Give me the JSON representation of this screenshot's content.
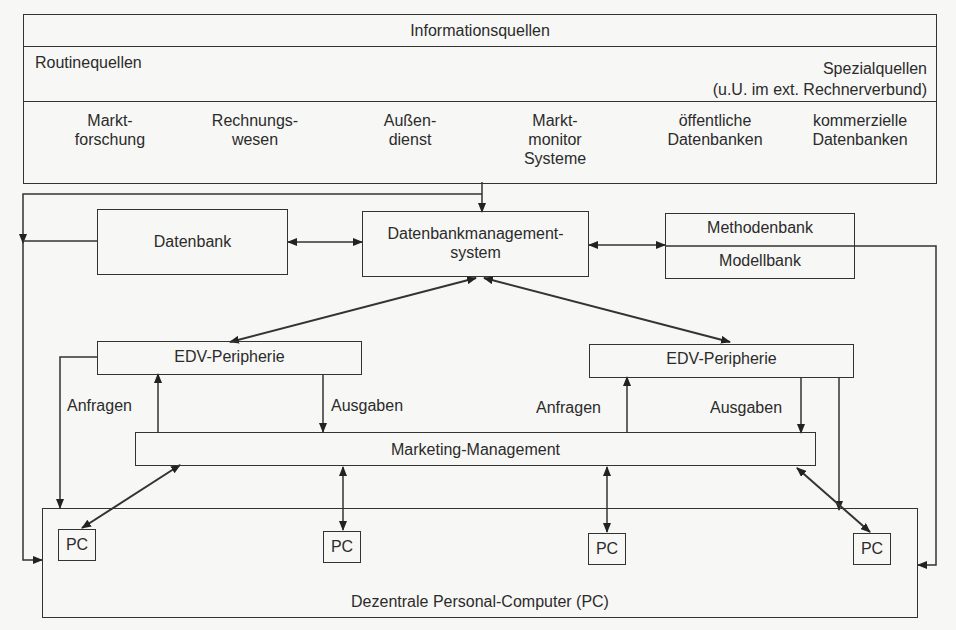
{
  "diagram": {
    "sources": {
      "title": "Informationsquellen",
      "routine_label": "Routinequellen",
      "special_label_1": "Spezialquellen",
      "special_label_2": "(u.U. im ext. Rechnerverbund)",
      "items": [
        {
          "line1": "Markt-",
          "line2": "forschung",
          "line3": ""
        },
        {
          "line1": "Rechnungs-",
          "line2": "wesen",
          "line3": ""
        },
        {
          "line1": "Außen-",
          "line2": "dienst",
          "line3": ""
        },
        {
          "line1": "Markt-",
          "line2": "monitor",
          "line3": "Systeme"
        },
        {
          "line1": "öffentliche",
          "line2": "Datenbanken",
          "line3": ""
        },
        {
          "line1": "kommerzielle",
          "line2": "Datenbanken",
          "line3": ""
        }
      ]
    },
    "datenbank": "Datenbank",
    "dbms_line1": "Datenbankmanagement-",
    "dbms_line2": "system",
    "methodenbank": "Methodenbank",
    "modellbank": "Modellbank",
    "edv_left": "EDV-Peripherie",
    "edv_right": "EDV-Peripherie",
    "anfragen_left": "Anfragen",
    "ausgaben_left": "Ausgaben",
    "anfragen_right": "Anfragen",
    "ausgaben_right": "Ausgaben",
    "marketing": "Marketing-Management",
    "pcs": [
      "PC",
      "PC",
      "PC",
      "PC"
    ],
    "dezentrale": "Dezentrale Personal-Computer (PC)"
  }
}
